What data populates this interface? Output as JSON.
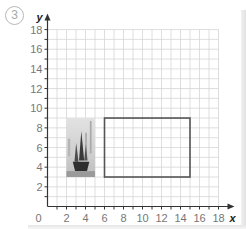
{
  "question_number": "3",
  "chart_data": {
    "type": "coordinate-grid",
    "title": "",
    "xlabel": "x",
    "ylabel": "y",
    "xlim": [
      0,
      18
    ],
    "ylim": [
      0,
      18
    ],
    "grid": true,
    "grid_step": 1,
    "x_ticks": [
      2,
      4,
      6,
      8,
      10,
      12,
      14,
      16,
      18
    ],
    "y_ticks": [
      2,
      4,
      6,
      8,
      10,
      12,
      14,
      16,
      18
    ],
    "origin_label": "0",
    "shapes": [
      {
        "name": "photo",
        "kind": "image",
        "description": "grayscale photo of a junk boat with sails",
        "x_min": 2,
        "x_max": 5,
        "y_min": 3,
        "y_max": 9
      },
      {
        "name": "rectangle",
        "kind": "rectangle-outline",
        "x_min": 6,
        "x_max": 15,
        "y_min": 3,
        "y_max": 9
      }
    ]
  },
  "colors": {
    "grid": "#d6d6d6",
    "axis": "#333333",
    "rectangle": "#555555",
    "label": "#777777",
    "qnum": "#a8a8a8"
  }
}
